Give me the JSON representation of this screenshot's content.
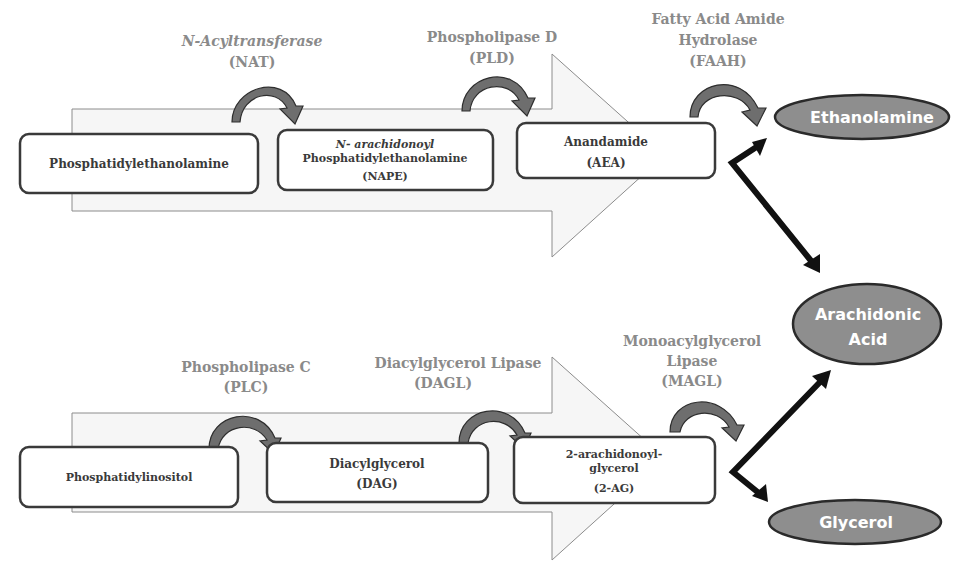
{
  "diagram": {
    "type": "biochemical-pathway",
    "colors": {
      "enzyme_text": "#8a8a8a",
      "node_text": "#3a3a3a",
      "product_fill": "#8e8e8e",
      "curve_arrow_fill": "#6e6e6e",
      "background_arrow_fill": "#f6f6f6",
      "link_arrow": "#111111"
    },
    "pathways": [
      {
        "name": "anandamide-pathway",
        "nodes": [
          {
            "id": "pe",
            "lines": [
              "Phosphatidylethanolamine"
            ]
          },
          {
            "id": "nape",
            "lines": [
              "N- arachidonoyl",
              "Phosphatidylethanolamine",
              "(NAPE)"
            ]
          },
          {
            "id": "aea",
            "lines": [
              "Anandamide",
              "(AEA)"
            ]
          }
        ],
        "enzymes": [
          {
            "id": "nat",
            "lines": [
              "N-Acyltransferase",
              "(NAT)"
            ]
          },
          {
            "id": "pld",
            "lines": [
              "Phospholipase D",
              "(PLD)"
            ]
          },
          {
            "id": "faah",
            "lines": [
              "Fatty Acid Amide",
              "Hydrolase",
              "(FAAH)"
            ]
          }
        ]
      },
      {
        "name": "2ag-pathway",
        "nodes": [
          {
            "id": "pi",
            "lines": [
              "Phosphatidylinositol"
            ]
          },
          {
            "id": "dag",
            "lines": [
              "Diacylglycerol",
              "(DAG)"
            ]
          },
          {
            "id": "2ag",
            "lines": [
              "2-arachidonoyl-",
              "glycerol",
              "(2-AG)"
            ]
          }
        ],
        "enzymes": [
          {
            "id": "plc",
            "lines": [
              "Phospholipase C",
              "(PLC)"
            ]
          },
          {
            "id": "dagl",
            "lines": [
              "Diacylglycerol Lipase",
              "(DAGL)"
            ]
          },
          {
            "id": "magl",
            "lines": [
              "Monoacylglycerol",
              "Lipase",
              "(MAGL)"
            ]
          }
        ]
      }
    ],
    "products": [
      {
        "id": "ethanolamine",
        "lines": [
          "Ethanolamine"
        ]
      },
      {
        "id": "arachidonic-acid",
        "lines": [
          "Arachidonic",
          "Acid"
        ]
      },
      {
        "id": "glycerol",
        "lines": [
          "Glycerol"
        ]
      }
    ],
    "edges": [
      {
        "from": "pe",
        "to": "nape",
        "via": "nat"
      },
      {
        "from": "nape",
        "to": "aea",
        "via": "pld"
      },
      {
        "from": "aea",
        "to": [
          "ethanolamine",
          "arachidonic-acid"
        ],
        "via": "faah"
      },
      {
        "from": "pi",
        "to": "dag",
        "via": "plc"
      },
      {
        "from": "dag",
        "to": "2ag",
        "via": "dagl"
      },
      {
        "from": "2ag",
        "to": [
          "arachidonic-acid",
          "glycerol"
        ],
        "via": "magl"
      }
    ]
  }
}
